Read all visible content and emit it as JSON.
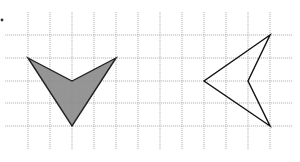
{
  "figure": {
    "marker": {
      "x": 2,
      "y": 20
    },
    "grid": {
      "vertical_x": [
        28,
        50,
        72,
        94,
        116,
        138,
        160,
        182,
        204,
        226,
        248,
        270
      ],
      "vertical_y_range": [
        12,
        150
      ],
      "horizontal_y": [
        35,
        58,
        81,
        103,
        126
      ],
      "horizontal_x_range": [
        5,
        293
      ],
      "color": "#b5b5b5"
    },
    "shapes": [
      {
        "name": "shaded-arrowhead",
        "points": [
          [
            28,
            58
          ],
          [
            72,
            81
          ],
          [
            116,
            58
          ],
          [
            72,
            126
          ]
        ],
        "fill": "#8a8a8a",
        "fill_opacity": 0.9,
        "stroke": "#222222"
      },
      {
        "name": "outlined-arrowhead",
        "points": [
          [
            270,
            35
          ],
          [
            204,
            81
          ],
          [
            270,
            126
          ],
          [
            248,
            81
          ]
        ],
        "fill": "none",
        "stroke": "#111111"
      }
    ]
  }
}
